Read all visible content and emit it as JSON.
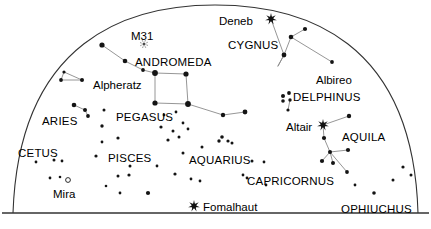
{
  "chart_data": {
    "type": "scatter",
    "xlabel": "",
    "ylabel": "",
    "xlim": [
      0,
      431
    ],
    "ylim": [
      0,
      229
    ],
    "grid": false,
    "legend_position": "none",
    "projection": {
      "shape": "half-dome-over-horizon",
      "horizon_line_y": 213,
      "dome_left_x": 13,
      "dome_right_x": 418,
      "dome_apex_x": 215,
      "dome_apex_y": 5,
      "frame_color": "#333333"
    },
    "labels": [
      {
        "text": "M31",
        "kind": "object",
        "x": 131,
        "y": 31,
        "anchor": "start"
      },
      {
        "text": "ANDROMEDA",
        "kind": "constellation",
        "x": 135,
        "y": 57,
        "anchor": "start"
      },
      {
        "text": "Alpheratz",
        "kind": "star",
        "x": 93,
        "y": 80,
        "anchor": "start"
      },
      {
        "text": "ARIES",
        "kind": "constellation",
        "x": 42,
        "y": 116,
        "anchor": "start"
      },
      {
        "text": "PEGASUS",
        "kind": "constellation",
        "x": 116,
        "y": 112,
        "anchor": "start"
      },
      {
        "text": "CETUS",
        "kind": "constellation",
        "x": 18,
        "y": 148,
        "anchor": "start"
      },
      {
        "text": "PISCES",
        "kind": "constellation",
        "x": 108,
        "y": 153,
        "anchor": "start"
      },
      {
        "text": "Mira",
        "kind": "star",
        "x": 53,
        "y": 189,
        "anchor": "start"
      },
      {
        "text": "AQUARIUS",
        "kind": "constellation",
        "x": 189,
        "y": 155,
        "anchor": "start"
      },
      {
        "text": "Fomalhaut",
        "kind": "star",
        "x": 203,
        "y": 202,
        "anchor": "start"
      },
      {
        "text": "CAPRICORNUS",
        "kind": "constellation",
        "x": 247,
        "y": 176,
        "anchor": "start"
      },
      {
        "text": "Deneb",
        "kind": "star",
        "x": 219,
        "y": 16,
        "anchor": "start"
      },
      {
        "text": "CYGNUS",
        "kind": "constellation",
        "x": 228,
        "y": 40,
        "anchor": "start"
      },
      {
        "text": "Albireo",
        "kind": "star",
        "x": 316,
        "y": 75,
        "anchor": "start"
      },
      {
        "text": "DELPHINUS",
        "kind": "constellation",
        "x": 293,
        "y": 92,
        "anchor": "start"
      },
      {
        "text": "Altair",
        "kind": "star",
        "x": 286,
        "y": 122,
        "anchor": "start"
      },
      {
        "text": "AQUILA",
        "kind": "constellation",
        "x": 342,
        "y": 132,
        "anchor": "start"
      },
      {
        "text": "OPHIUCHUS",
        "kind": "constellation",
        "x": 341,
        "y": 204,
        "anchor": "start"
      }
    ],
    "bright_stars": [
      {
        "name": "Deneb",
        "x": 271,
        "y": 19,
        "glyph": "starburst"
      },
      {
        "name": "Altair",
        "x": 323,
        "y": 125,
        "glyph": "starburst"
      },
      {
        "name": "Fomalhaut",
        "x": 194,
        "y": 206,
        "glyph": "starburst"
      }
    ],
    "variable_stars": [
      {
        "name": "Mira",
        "x": 68,
        "y": 180,
        "glyph": "open-circle",
        "r": 2.4
      }
    ],
    "nebulae": [
      {
        "name": "M31",
        "x": 144,
        "y": 44,
        "glyph": "fuzzy-dot"
      }
    ],
    "stars": [
      {
        "x": 102,
        "y": 45,
        "r": 2.6
      },
      {
        "x": 125,
        "y": 61,
        "r": 2.3
      },
      {
        "x": 143,
        "y": 70,
        "r": 1.9
      },
      {
        "x": 155,
        "y": 73,
        "r": 2.9
      },
      {
        "x": 186,
        "y": 74,
        "r": 2.6
      },
      {
        "x": 155,
        "y": 103,
        "r": 2.6
      },
      {
        "x": 188,
        "y": 104,
        "r": 2.9
      },
      {
        "x": 223,
        "y": 115,
        "r": 2.2
      },
      {
        "x": 245,
        "y": 112,
        "r": 2.4
      },
      {
        "x": 64,
        "y": 72,
        "r": 1.6
      },
      {
        "x": 61,
        "y": 80,
        "r": 1.9
      },
      {
        "x": 82,
        "y": 80,
        "r": 2.0
      },
      {
        "x": 74,
        "y": 105,
        "r": 2.3
      },
      {
        "x": 85,
        "y": 110,
        "r": 2.0
      },
      {
        "x": 88,
        "y": 116,
        "r": 1.9
      },
      {
        "x": 104,
        "y": 110,
        "r": 1.5
      },
      {
        "x": 102,
        "y": 126,
        "r": 1.7
      },
      {
        "x": 102,
        "y": 142,
        "r": 1.4
      },
      {
        "x": 118,
        "y": 138,
        "r": 1.6
      },
      {
        "x": 96,
        "y": 156,
        "r": 1.6
      },
      {
        "x": 118,
        "y": 176,
        "r": 1.5
      },
      {
        "x": 106,
        "y": 186,
        "r": 1.3
      },
      {
        "x": 129,
        "y": 175,
        "r": 1.6
      },
      {
        "x": 120,
        "y": 193,
        "r": 1.4
      },
      {
        "x": 148,
        "y": 193,
        "r": 2.1
      },
      {
        "x": 130,
        "y": 166,
        "r": 1.5
      },
      {
        "x": 157,
        "y": 166,
        "r": 1.4
      },
      {
        "x": 36,
        "y": 162,
        "r": 1.4
      },
      {
        "x": 54,
        "y": 160,
        "r": 1.5
      },
      {
        "x": 62,
        "y": 161,
        "r": 1.4
      },
      {
        "x": 50,
        "y": 178,
        "r": 1.4
      },
      {
        "x": 60,
        "y": 177,
        "r": 1.3
      },
      {
        "x": 161,
        "y": 127,
        "r": 1.6
      },
      {
        "x": 173,
        "y": 131,
        "r": 1.5
      },
      {
        "x": 179,
        "y": 137,
        "r": 1.5
      },
      {
        "x": 168,
        "y": 140,
        "r": 1.6
      },
      {
        "x": 183,
        "y": 123,
        "r": 1.4
      },
      {
        "x": 164,
        "y": 115,
        "r": 1.4
      },
      {
        "x": 176,
        "y": 112,
        "r": 1.4
      },
      {
        "x": 183,
        "y": 153,
        "r": 1.5
      },
      {
        "x": 202,
        "y": 147,
        "r": 1.5
      },
      {
        "x": 175,
        "y": 174,
        "r": 1.6
      },
      {
        "x": 191,
        "y": 179,
        "r": 1.4
      },
      {
        "x": 200,
        "y": 181,
        "r": 1.4
      },
      {
        "x": 219,
        "y": 141,
        "r": 1.7
      },
      {
        "x": 222,
        "y": 137,
        "r": 1.8
      },
      {
        "x": 228,
        "y": 141,
        "r": 1.6
      },
      {
        "x": 232,
        "y": 143,
        "r": 1.5
      },
      {
        "x": 188,
        "y": 129,
        "r": 1.4
      },
      {
        "x": 252,
        "y": 161,
        "r": 1.5
      },
      {
        "x": 264,
        "y": 162,
        "r": 1.4
      },
      {
        "x": 243,
        "y": 175,
        "r": 1.4
      },
      {
        "x": 247,
        "y": 178,
        "r": 1.4
      },
      {
        "x": 266,
        "y": 185,
        "r": 1.4
      },
      {
        "x": 291,
        "y": 37,
        "r": 2.3
      },
      {
        "x": 305,
        "y": 29,
        "r": 2.1
      },
      {
        "x": 284,
        "y": 55,
        "r": 2.4
      },
      {
        "x": 332,
        "y": 62,
        "r": 1.9
      },
      {
        "x": 283,
        "y": 96,
        "r": 2.0
      },
      {
        "x": 289,
        "y": 93,
        "r": 1.9
      },
      {
        "x": 283,
        "y": 101,
        "r": 1.8
      },
      {
        "x": 290,
        "y": 100,
        "r": 1.7
      },
      {
        "x": 288,
        "y": 110,
        "r": 1.6
      },
      {
        "x": 349,
        "y": 116,
        "r": 2.2
      },
      {
        "x": 324,
        "y": 138,
        "r": 2.1
      },
      {
        "x": 330,
        "y": 152,
        "r": 2.0
      },
      {
        "x": 348,
        "y": 150,
        "r": 2.1
      },
      {
        "x": 322,
        "y": 161,
        "r": 2.1
      },
      {
        "x": 333,
        "y": 163,
        "r": 2.0
      },
      {
        "x": 347,
        "y": 172,
        "r": 1.9
      },
      {
        "x": 403,
        "y": 167,
        "r": 1.6
      },
      {
        "x": 393,
        "y": 180,
        "r": 1.5
      },
      {
        "x": 411,
        "y": 175,
        "r": 1.5
      },
      {
        "x": 374,
        "y": 193,
        "r": 1.8
      },
      {
        "x": 355,
        "y": 185,
        "r": 1.4
      }
    ],
    "constellation_lines": [
      {
        "name": "andromeda-chain",
        "points": [
          [
            102,
            45
          ],
          [
            125,
            61
          ],
          [
            143,
            70
          ],
          [
            155,
            73
          ]
        ]
      },
      {
        "name": "pegasus-square-top",
        "points": [
          [
            155,
            73
          ],
          [
            186,
            74
          ]
        ]
      },
      {
        "name": "pegasus-square-right",
        "points": [
          [
            186,
            74
          ],
          [
            188,
            104
          ]
        ]
      },
      {
        "name": "pegasus-square-bottom",
        "points": [
          [
            188,
            104
          ],
          [
            155,
            103
          ]
        ]
      },
      {
        "name": "pegasus-square-left",
        "points": [
          [
            155,
            103
          ],
          [
            155,
            73
          ]
        ]
      },
      {
        "name": "pegasus-wing",
        "points": [
          [
            188,
            104
          ],
          [
            223,
            115
          ],
          [
            245,
            112
          ]
        ]
      },
      {
        "name": "alpheratz-triangle",
        "points": [
          [
            64,
            72
          ],
          [
            61,
            80
          ],
          [
            82,
            80
          ],
          [
            64,
            72
          ]
        ]
      },
      {
        "name": "aries-chain",
        "points": [
          [
            74,
            105
          ],
          [
            85,
            110
          ],
          [
            88,
            116
          ]
        ]
      },
      {
        "name": "cygnus-spine",
        "points": [
          [
            271,
            19
          ],
          [
            284,
            55
          ],
          [
            284,
            55
          ]
        ]
      },
      {
        "name": "cygnus-cross-arm",
        "points": [
          [
            305,
            29
          ],
          [
            291,
            37
          ],
          [
            284,
            55
          ],
          [
            278,
            66
          ]
        ]
      },
      {
        "name": "cygnus-to-albireo",
        "points": [
          [
            291,
            37
          ],
          [
            332,
            62
          ]
        ]
      },
      {
        "name": "cygnus-lower",
        "points": [
          [
            284,
            55
          ],
          [
            278,
            66
          ]
        ]
      },
      {
        "name": "aquila-altair-top",
        "points": [
          [
            323,
            125
          ],
          [
            349,
            116
          ]
        ]
      },
      {
        "name": "aquila-spine",
        "points": [
          [
            323,
            125
          ],
          [
            324,
            138
          ],
          [
            330,
            152
          ],
          [
            347,
            172
          ]
        ]
      },
      {
        "name": "aquila-arm",
        "points": [
          [
            322,
            161
          ],
          [
            330,
            152
          ],
          [
            348,
            150
          ]
        ]
      },
      {
        "name": "aquila-arm2",
        "points": [
          [
            333,
            163
          ],
          [
            330,
            152
          ]
        ]
      },
      {
        "name": "delphinus-tail",
        "points": [
          [
            288,
            110
          ],
          [
            290,
            100
          ]
        ]
      }
    ]
  }
}
